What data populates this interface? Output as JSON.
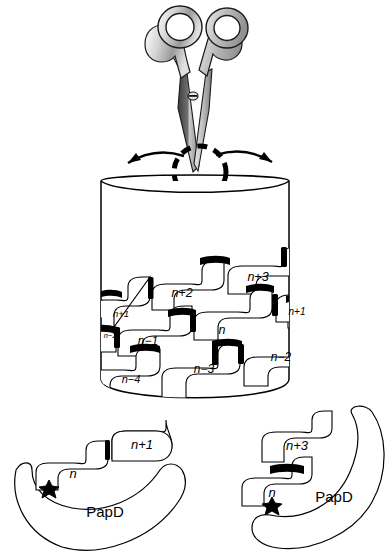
{
  "figure": {
    "background_color": "#ffffff",
    "line_color": "#000000",
    "connector_color": "#000000"
  },
  "tool": {
    "name": "scissors-icon",
    "description": "open scissors cutting into the pilus rod",
    "blade_fill_dark": "#4a4a4a",
    "blade_fill_light": "#d9d9d9",
    "handle_stroke": "#000000"
  },
  "cut_marker": {
    "name": "dashed-circle",
    "dash_count": 10,
    "stroke_width": 5
  },
  "arrows": [
    {
      "name": "arrow-left",
      "direction": "left"
    },
    {
      "name": "arrow-right",
      "direction": "right"
    }
  ],
  "cylinder": {
    "name": "pilus-rod-cylinder",
    "label": "",
    "subunits": [
      {
        "id": "s1",
        "label": "n+3",
        "x": 258,
        "y": 281
      },
      {
        "id": "s2",
        "label": "n+2",
        "x": 182,
        "y": 297
      },
      {
        "id": "s3",
        "label": "n+1",
        "x": 121,
        "y": 317
      },
      {
        "id": "s4",
        "label": "n+1",
        "x": 297,
        "y": 315
      },
      {
        "id": "s5",
        "label": "n",
        "x": 222,
        "y": 334
      },
      {
        "id": "s6",
        "label": "n−1",
        "x": 148,
        "y": 345
      },
      {
        "id": "s7",
        "label": "n−2",
        "x": 110,
        "y": 338
      },
      {
        "id": "s8",
        "label": "n−2",
        "x": 281,
        "y": 361
      },
      {
        "id": "s9",
        "label": "n−3",
        "x": 204,
        "y": 373
      },
      {
        "id": "s10",
        "label": "n−4",
        "x": 131,
        "y": 383
      }
    ]
  },
  "complex_left": {
    "name": "papd-complex-left",
    "chaperone_label": "PapD",
    "subunits": [
      {
        "label": "n",
        "x": 73,
        "y": 478
      },
      {
        "label": "n+1",
        "x": 142,
        "y": 445
      }
    ],
    "star": {
      "name": "star-marker",
      "x": 49,
      "y": 488
    }
  },
  "complex_right": {
    "name": "papd-complex-right",
    "chaperone_label": "PapD",
    "subunits": [
      {
        "label": "n+3",
        "x": 297,
        "y": 445
      },
      {
        "label": "n",
        "x": 272,
        "y": 492
      }
    ],
    "star": {
      "name": "star-marker",
      "x": 272,
      "y": 505
    }
  }
}
